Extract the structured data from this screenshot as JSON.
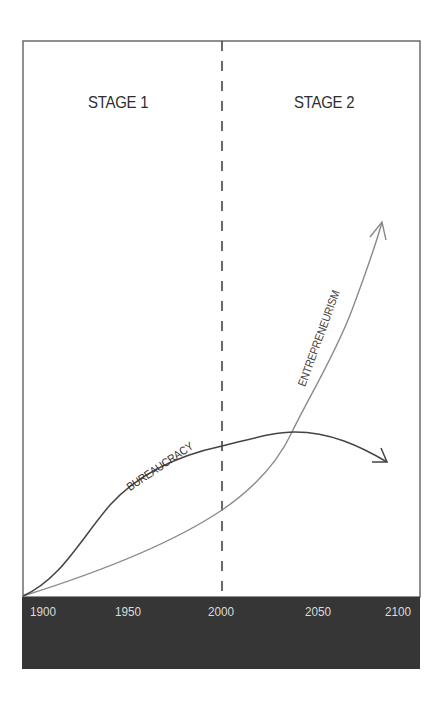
{
  "diagram": {
    "stages": [
      {
        "label": "STAGE 1"
      },
      {
        "label": "STAGE 2"
      }
    ],
    "axis": {
      "ticks": [
        "1900",
        "1950",
        "2000",
        "2050",
        "2100"
      ],
      "bar_color": "#363636",
      "tick_color": "#dcdcdc"
    },
    "divider": {
      "at": "2000",
      "style": "dashed"
    },
    "curves": [
      {
        "name": "bureaucracy",
        "label": "BUREAUCRACY",
        "color": "#444444"
      },
      {
        "name": "entrepreneurism",
        "label": "ENTREPRENEURISM",
        "color": "#8a8a8a"
      }
    ]
  }
}
